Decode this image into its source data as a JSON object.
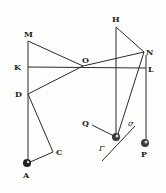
{
  "figure": {
    "labels": {
      "M": "M",
      "K": "K",
      "D": "D",
      "A": "A",
      "C": "C",
      "O": "O",
      "H": "H",
      "N": "N",
      "L": "L",
      "P": "P",
      "Q": "Q",
      "sigma": "σ",
      "gamma": "Γ"
    },
    "colors": {
      "ink": "#2a2a2a",
      "paper": "#fdfdfb"
    }
  }
}
